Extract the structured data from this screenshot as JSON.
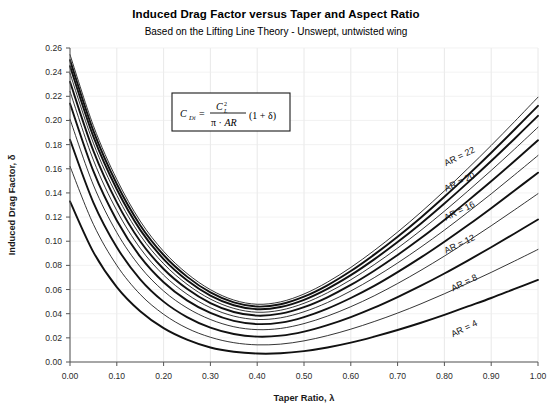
{
  "chart_data": {
    "type": "line",
    "title": "Induced Drag Factor versus Taper and Aspect Ratio",
    "subtitle": "Based on the Lifting Line Theory - Unswept, untwisted wing",
    "xlabel": "Taper Ratio, λ",
    "ylabel": "Induced Drag Factor, δ",
    "xlim": [
      0.0,
      1.0
    ],
    "ylim": [
      0.0,
      0.26
    ],
    "xticks": [
      "0.00",
      "0.10",
      "0.20",
      "0.30",
      "0.40",
      "0.50",
      "0.60",
      "0.70",
      "0.80",
      "0.90",
      "1.00"
    ],
    "xtick_values": [
      0.0,
      0.1,
      0.2,
      0.3,
      0.4,
      0.5,
      0.6,
      0.7,
      0.8,
      0.9,
      1.0
    ],
    "yticks": [
      "0.00",
      "0.02",
      "0.04",
      "0.06",
      "0.08",
      "0.10",
      "0.12",
      "0.14",
      "0.16",
      "0.18",
      "0.20",
      "0.22",
      "0.24",
      "0.26"
    ],
    "ytick_values": [
      0.0,
      0.02,
      0.04,
      0.06,
      0.08,
      0.1,
      0.12,
      0.14,
      0.16,
      0.18,
      0.2,
      0.22,
      0.24,
      0.26
    ],
    "grid": true,
    "legend_position": "inline-right-labels",
    "annotation": {
      "equation_text": "C_Di = C_L^2 / (π · AR) · (1 + δ)",
      "boxed": true
    },
    "x": [
      0.0,
      0.05,
      0.1,
      0.15,
      0.2,
      0.25,
      0.3,
      0.35,
      0.4,
      0.45,
      0.5,
      0.55,
      0.6,
      0.65,
      0.7,
      0.75,
      0.8,
      0.85,
      0.9,
      0.95,
      1.0
    ],
    "series": [
      {
        "name": "AR = 4",
        "label": "AR = 4",
        "labeled": true,
        "values": [
          0.133,
          0.091,
          0.062,
          0.042,
          0.028,
          0.0185,
          0.012,
          0.0085,
          0.007,
          0.0072,
          0.009,
          0.012,
          0.016,
          0.021,
          0.0265,
          0.0325,
          0.039,
          0.046,
          0.053,
          0.0605,
          0.068
        ]
      },
      {
        "name": "AR = 6",
        "label": "",
        "labeled": false,
        "values": [
          0.162,
          0.114,
          0.08,
          0.056,
          0.0395,
          0.028,
          0.0205,
          0.016,
          0.0142,
          0.0148,
          0.0175,
          0.0218,
          0.0272,
          0.0335,
          0.0405,
          0.0482,
          0.0565,
          0.0652,
          0.0742,
          0.0836,
          0.0932
        ]
      },
      {
        "name": "AR = 8",
        "label": "AR = 8",
        "labeled": true,
        "values": [
          0.184,
          0.132,
          0.095,
          0.0685,
          0.05,
          0.0372,
          0.0285,
          0.0232,
          0.021,
          0.0218,
          0.0252,
          0.0305,
          0.0372,
          0.045,
          0.0538,
          0.0632,
          0.0733,
          0.084,
          0.095,
          0.1064,
          0.118
        ]
      },
      {
        "name": "AR = 10",
        "label": "",
        "labeled": false,
        "values": [
          0.201,
          0.1465,
          0.1072,
          0.0788,
          0.0588,
          0.0448,
          0.0352,
          0.0292,
          0.0268,
          0.0278,
          0.0318,
          0.038,
          0.0458,
          0.0548,
          0.065,
          0.076,
          0.0877,
          0.1,
          0.1128,
          0.126,
          0.1394
        ]
      },
      {
        "name": "AR = 12",
        "label": "AR = 12",
        "labeled": true,
        "values": [
          0.214,
          0.158,
          0.1172,
          0.0872,
          0.066,
          0.051,
          0.0406,
          0.034,
          0.0314,
          0.0326,
          0.0372,
          0.0442,
          0.053,
          0.063,
          0.0744,
          0.0866,
          0.0996,
          0.1132,
          0.1274,
          0.142,
          0.1568
        ]
      },
      {
        "name": "AR = 14",
        "label": "",
        "labeled": false,
        "values": [
          0.224,
          0.1672,
          0.1254,
          0.0942,
          0.072,
          0.0562,
          0.045,
          0.038,
          0.0352,
          0.0366,
          0.0416,
          0.0492,
          0.0588,
          0.0698,
          0.082,
          0.0952,
          0.1092,
          0.124,
          0.1392,
          0.155,
          0.171
        ]
      },
      {
        "name": "AR = 16",
        "label": "AR = 16",
        "labeled": true,
        "values": [
          0.232,
          0.1748,
          0.1322,
          0.1,
          0.077,
          0.0606,
          0.0488,
          0.0414,
          0.0384,
          0.04,
          0.0454,
          0.0536,
          0.0638,
          0.0756,
          0.0886,
          0.1026,
          0.1176,
          0.1334,
          0.1496,
          0.1664,
          0.1836
        ]
      },
      {
        "name": "AR = 18",
        "label": "",
        "labeled": false,
        "values": [
          0.239,
          0.1812,
          0.138,
          0.105,
          0.0814,
          0.0644,
          0.0521,
          0.0444,
          0.0412,
          0.0429,
          0.0486,
          0.0573,
          0.0681,
          0.0806,
          0.0943,
          0.1091,
          0.1249,
          0.1415,
          0.1586,
          0.1763,
          0.1944
        ]
      },
      {
        "name": "AR = 20",
        "label": "AR = 20",
        "labeled": true,
        "values": [
          0.245,
          0.1866,
          0.143,
          0.1094,
          0.0852,
          0.0677,
          0.055,
          0.047,
          0.0437,
          0.0455,
          0.0515,
          0.0606,
          0.0719,
          0.085,
          0.0993,
          0.1147,
          0.1312,
          0.1485,
          0.1664,
          0.1849,
          0.2038
        ]
      },
      {
        "name": "AR = 22",
        "label": "AR = 22",
        "labeled": true,
        "values": [
          0.25,
          0.1914,
          0.1474,
          0.1133,
          0.0886,
          0.0707,
          0.0576,
          0.0493,
          0.0459,
          0.0478,
          0.0541,
          0.0635,
          0.0753,
          0.0889,
          0.1037,
          0.1197,
          0.1368,
          0.1547,
          0.1733,
          0.1925,
          0.2121
        ]
      },
      {
        "name": "AR = 24",
        "label": "",
        "labeled": false,
        "values": [
          0.2545,
          0.1956,
          0.1512,
          0.1167,
          0.0916,
          0.0733,
          0.0599,
          0.0513,
          0.0478,
          0.0498,
          0.0563,
          0.0661,
          0.0783,
          0.0923,
          0.1076,
          0.1241,
          0.1417,
          0.1602,
          0.1793,
          0.1991,
          0.2193
        ]
      }
    ],
    "ar_labels": [
      {
        "text": "AR = 22",
        "x": 0.835,
        "y": 0.168
      },
      {
        "text": "AR = 20",
        "x": 0.835,
        "y": 0.147
      },
      {
        "text": "AR = 16",
        "x": 0.835,
        "y": 0.123
      },
      {
        "text": "AR = 12",
        "x": 0.835,
        "y": 0.0955
      },
      {
        "text": "AR = 8",
        "x": 0.845,
        "y": 0.0635
      },
      {
        "text": "AR = 4",
        "x": 0.845,
        "y": 0.0255
      }
    ]
  }
}
